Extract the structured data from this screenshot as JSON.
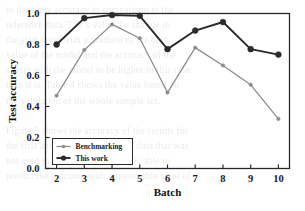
{
  "figure": {
    "background_color": "#ffffff",
    "frame_color": "#2a2a2a",
    "bleed_through_text": "to the same accuracy in comparison to the\nreference data. The x value the sample in\nthe start layer with a gradient to the best\nvalue of the model and the accuracy of the\nsubset with the model to be higher in this case\nthan it is. Table 4 shows the value based on\nthe validation of the whole sample set.\n\nFigure 5 shows the accuracy of the results for\nthe first and second batch of the data that was\nnot used in training. The model is able to\npredict the outcome with a reasonable level of"
  },
  "chart_data": {
    "type": "line",
    "title": "",
    "xlabel": "Batch",
    "ylabel": "Test accuracy",
    "categories": [
      2,
      3,
      4,
      5,
      6,
      7,
      8,
      9,
      10
    ],
    "x": [
      2,
      3,
      4,
      5,
      6,
      7,
      8,
      9,
      10
    ],
    "xlim": [
      1.6,
      10.4
    ],
    "ylim": [
      0.0,
      1.0
    ],
    "xticks": [
      "2",
      "3",
      "4",
      "5",
      "6",
      "7",
      "8",
      "9",
      "10"
    ],
    "yticks": [
      "0.0",
      "0.2",
      "0.4",
      "0.6",
      "0.8",
      "1.0"
    ],
    "ytick_values": [
      0.0,
      0.2,
      0.4,
      0.6,
      0.8,
      1.0
    ],
    "grid": false,
    "legend_position": "lower left",
    "series": [
      {
        "name": "Benchmarking",
        "color": "#8c8c8c",
        "marker": "circle-small",
        "values": [
          0.47,
          0.765,
          0.93,
          0.84,
          0.49,
          0.78,
          0.665,
          0.54,
          0.32
        ]
      },
      {
        "name": "This work",
        "color": "#2b2b2b",
        "marker": "circle",
        "values": [
          0.8,
          0.97,
          0.99,
          0.985,
          0.77,
          0.89,
          0.945,
          0.77,
          0.735
        ]
      }
    ]
  }
}
